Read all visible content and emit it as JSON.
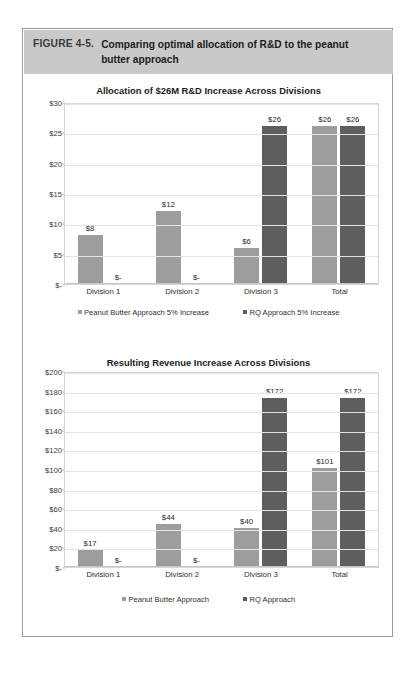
{
  "figure": {
    "label": "FIGURE 4-5.",
    "title": "Comparing optimal allocation of R&D to the peanut butter approach",
    "header_bg": "#c9c9c9",
    "border_color": "#9a9a9a"
  },
  "colors": {
    "series_light": "#9d9d9d",
    "series_dark": "#5e5e5e",
    "gridline": "#e3e3e3",
    "text": "#2f2f2f"
  },
  "chart_data": [
    {
      "id": "chart1",
      "type": "bar",
      "title": "Allocation of $26M R&D Increase Across Divisions",
      "xlabel": "",
      "ylabel": "",
      "ylim": [
        0,
        30
      ],
      "grid": true,
      "legend_position": "bottom",
      "yticks": [
        0,
        5,
        10,
        15,
        20,
        25,
        30
      ],
      "ytick_labels": [
        "$-",
        "$5",
        "$10",
        "$15",
        "$20",
        "$25",
        "$30"
      ],
      "categories": [
        "Division 1",
        "Division 2",
        "Division 3",
        "Total"
      ],
      "series": [
        {
          "name": "Peanut Butter Approach 5% Increase",
          "color": "#9d9d9d",
          "values": [
            8,
            12,
            6,
            26
          ],
          "labels": [
            "$8",
            "$12",
            "$6",
            "$26"
          ]
        },
        {
          "name": "RQ Approach 5% Increase",
          "color": "#5e5e5e",
          "values": [
            0,
            0,
            26,
            26
          ],
          "labels": [
            "$-",
            "$-",
            "$26",
            "$26"
          ]
        }
      ]
    },
    {
      "id": "chart2",
      "type": "bar",
      "title": "Resulting Revenue Increase Across Divisions",
      "xlabel": "",
      "ylabel": "",
      "ylim": [
        0,
        200
      ],
      "grid": true,
      "legend_position": "bottom",
      "yticks": [
        0,
        20,
        40,
        60,
        80,
        100,
        120,
        140,
        160,
        180,
        200
      ],
      "ytick_labels": [
        "$-",
        "$20",
        "$40",
        "$60",
        "$80",
        "$100",
        "$120",
        "$140",
        "$160",
        "$180",
        "$200"
      ],
      "categories": [
        "Division 1",
        "Division 2",
        "Division 3",
        "Total"
      ],
      "series": [
        {
          "name": "Peanut Butter Approach",
          "color": "#9d9d9d",
          "values": [
            17,
            44,
            40,
            101
          ],
          "labels": [
            "$17",
            "$44",
            "$40",
            "$101"
          ]
        },
        {
          "name": "RQ Approach",
          "color": "#5e5e5e",
          "values": [
            0,
            0,
            172,
            172
          ],
          "labels": [
            "$-",
            "$-",
            "$172",
            "$172"
          ]
        }
      ]
    }
  ]
}
